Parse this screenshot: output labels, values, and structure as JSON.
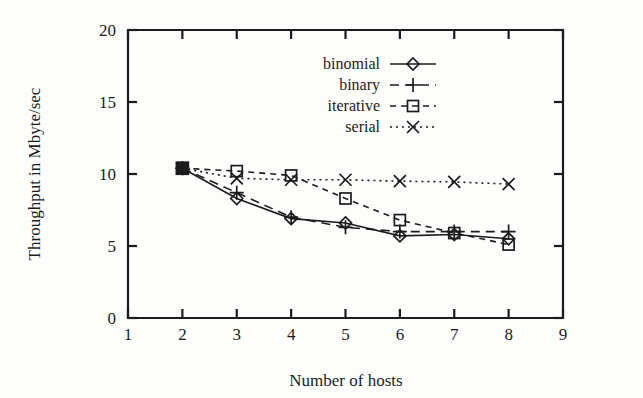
{
  "chart_data": {
    "type": "line",
    "title": "",
    "xlabel": "Number of hosts",
    "ylabel": "Throughput in Mbyte/sec",
    "xlim": [
      1,
      9
    ],
    "ylim": [
      0,
      20
    ],
    "xticks": [
      1,
      2,
      3,
      4,
      5,
      6,
      7,
      8,
      9
    ],
    "yticks": [
      0,
      5,
      10,
      15,
      20
    ],
    "xticklabels": [
      "1",
      "2",
      "3",
      "4",
      "5",
      "6",
      "7",
      "8",
      "9"
    ],
    "yticklabels": [
      "0",
      "5",
      "10",
      "15",
      "20"
    ],
    "grid": false,
    "legend_position": "upper center",
    "x": [
      2,
      3,
      4,
      5,
      6,
      7,
      8
    ],
    "series": [
      {
        "name": "binomial",
        "marker": "diamond",
        "linestyle": "solid",
        "values": [
          10.4,
          8.3,
          6.9,
          6.6,
          5.7,
          5.8,
          5.5
        ]
      },
      {
        "name": "binary",
        "marker": "plus",
        "linestyle": "dashed",
        "values": [
          10.4,
          8.7,
          7.0,
          6.3,
          6.0,
          6.0,
          6.0
        ]
      },
      {
        "name": "iterative",
        "marker": "square",
        "linestyle": "dashed-short",
        "values": [
          10.4,
          10.2,
          9.9,
          8.3,
          6.8,
          5.9,
          5.1
        ]
      },
      {
        "name": "serial",
        "marker": "cross",
        "linestyle": "dotted",
        "values": [
          10.4,
          9.7,
          9.6,
          9.6,
          9.5,
          9.45,
          9.3
        ]
      }
    ]
  },
  "legend": {
    "items": [
      {
        "label": "binomial"
      },
      {
        "label": "binary"
      },
      {
        "label": "iterative"
      },
      {
        "label": "serial"
      }
    ]
  },
  "axes": {
    "x_title": "Number of hosts",
    "y_title": "Throughput in Mbyte/sec"
  }
}
